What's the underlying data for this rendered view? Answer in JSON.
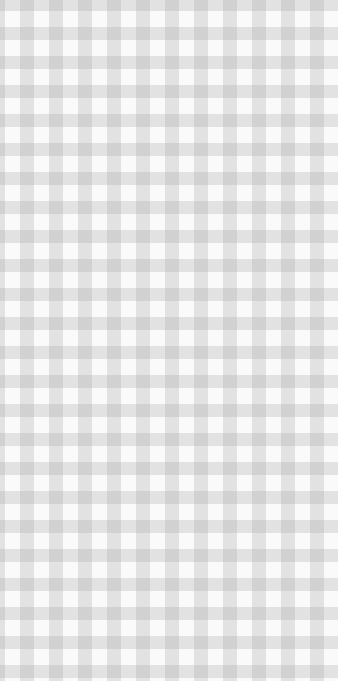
{
  "pattern": {
    "type": "gingham",
    "colors": {
      "light": "#fafafa",
      "mid": "#e4e4e4",
      "dark": "#cccccc"
    },
    "period_px": 29
  }
}
